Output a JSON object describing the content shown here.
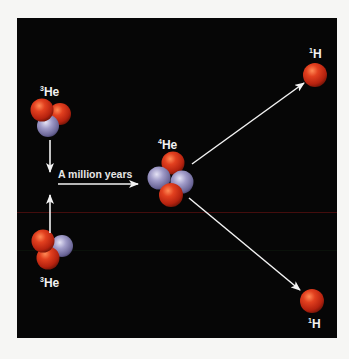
{
  "diagram": {
    "colors": {
      "background": "#060606",
      "page": "#f6f6f4",
      "proton": "#d8321c",
      "neutron": "#9a94c0",
      "arrow": "#f2f2f2",
      "text": "#f2f2f2"
    },
    "particles": {
      "he3_top": {
        "mass": "3",
        "element": "He"
      },
      "he3_bottom": {
        "mass": "3",
        "element": "He"
      },
      "he4": {
        "mass": "4",
        "element": "He"
      },
      "h1_top": {
        "mass": "1",
        "element": "H"
      },
      "h1_bottom": {
        "mass": "1",
        "element": "H"
      }
    },
    "caption": "A million years"
  }
}
